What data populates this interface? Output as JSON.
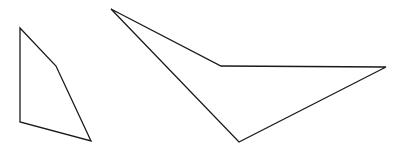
{
  "diagram": {
    "title": "",
    "shapes": [
      {
        "name": "quadrilateral-left",
        "kind": "polygon",
        "vertex_count": 4,
        "stroke": "#1a1a1a",
        "fill": "none"
      },
      {
        "name": "quadrilateral-right",
        "kind": "polygon",
        "vertex_count": 4,
        "stroke": "#1a1a1a",
        "fill": "none"
      }
    ]
  }
}
